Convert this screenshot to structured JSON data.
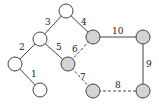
{
  "diagram": {
    "type": "graph",
    "colors": {
      "node_white": "#ffffff",
      "node_gray": "#d4d4d4",
      "stroke": "#444444"
    },
    "nodes": [
      {
        "id": "a",
        "x": 66,
        "y": 11,
        "fill": "white"
      },
      {
        "id": "b",
        "x": 40,
        "y": 39,
        "fill": "white"
      },
      {
        "id": "c",
        "x": 15,
        "y": 64,
        "fill": "white"
      },
      {
        "id": "d",
        "x": 40,
        "y": 90,
        "fill": "white"
      },
      {
        "id": "e",
        "x": 68,
        "y": 64,
        "fill": "gray"
      },
      {
        "id": "f",
        "x": 93,
        "y": 37,
        "fill": "gray"
      },
      {
        "id": "g",
        "x": 143,
        "y": 37,
        "fill": "gray"
      },
      {
        "id": "h",
        "x": 93,
        "y": 91,
        "fill": "gray"
      },
      {
        "id": "i",
        "x": 143,
        "y": 91,
        "fill": "gray"
      }
    ],
    "edges": [
      {
        "label": "1",
        "from": "c",
        "to": "d",
        "style": "solid"
      },
      {
        "label": "2",
        "from": "b",
        "to": "c",
        "style": "solid"
      },
      {
        "label": "3",
        "from": "a",
        "to": "b",
        "style": "solid"
      },
      {
        "label": "4",
        "from": "a",
        "to": "f",
        "style": "solid"
      },
      {
        "label": "5",
        "from": "b",
        "to": "e",
        "style": "solid"
      },
      {
        "label": "6",
        "from": "f",
        "to": "e",
        "style": "dashed"
      },
      {
        "label": "7",
        "from": "e",
        "to": "h",
        "style": "dashed"
      },
      {
        "label": "8",
        "from": "h",
        "to": "i",
        "style": "dashed"
      },
      {
        "label": "9",
        "from": "g",
        "to": "i",
        "style": "solid"
      },
      {
        "label": "10",
        "from": "f",
        "to": "g",
        "style": "solid"
      }
    ]
  }
}
